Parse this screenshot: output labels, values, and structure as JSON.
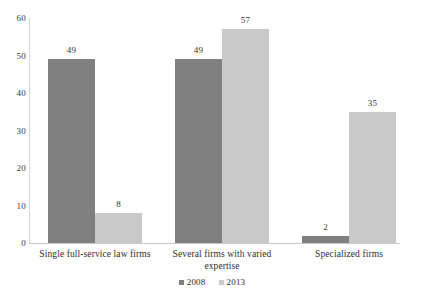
{
  "chart_data": {
    "type": "bar",
    "title": "",
    "subtitle": "",
    "xlabel": "",
    "ylabel": "",
    "ylim": [
      0,
      60
    ],
    "ytick_labels": [
      "0",
      "10",
      "20",
      "30",
      "40",
      "50",
      "60"
    ],
    "yticks": [
      0,
      10,
      20,
      30,
      40,
      50,
      60
    ],
    "grid": false,
    "legend_position": "bottom-center",
    "categories": [
      "Single full-service law firms",
      "Several firms with varied expertise",
      "Specialized firms"
    ],
    "series": [
      {
        "name": "2008",
        "color": "#808080",
        "values": [
          49,
          49,
          2
        ],
        "value_labels": [
          "49",
          "49",
          "2"
        ]
      },
      {
        "name": "2013",
        "color": "#c9c9c9",
        "values": [
          8,
          57,
          35
        ],
        "value_labels": [
          "8",
          "57",
          "35"
        ]
      }
    ]
  },
  "axis": {
    "y_color": "#d4d4d4",
    "x_color": "#c9c9c9"
  },
  "legend": {
    "entries": [
      {
        "label": "2008",
        "color": "#808080"
      },
      {
        "label": "2013",
        "color": "#c9c9c9"
      }
    ]
  }
}
